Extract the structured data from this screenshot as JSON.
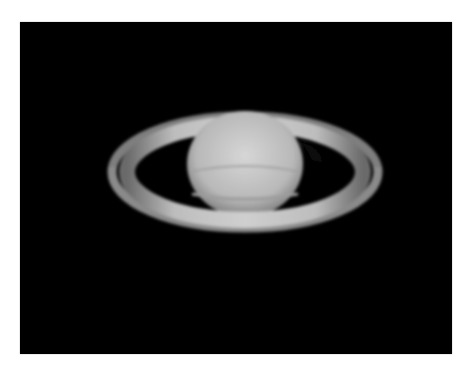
{
  "image": {
    "subject": "Saturn",
    "description": "Telescope photograph of the planet Saturn with its rings on a black background",
    "colors": {
      "background": "#000000",
      "border": "#ffffff",
      "planet": "#c8c8c8",
      "rings": "#b4b4b4"
    }
  }
}
